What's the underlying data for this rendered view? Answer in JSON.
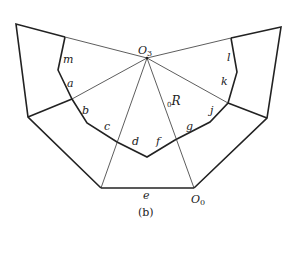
{
  "figure": {
    "caption": "(b)",
    "points": {
      "O3": "O",
      "O3_sub": "3",
      "O0": "O",
      "O0_sub": "0",
      "R": "R",
      "R_prefix": "0"
    },
    "edge_labels": {
      "m": "m",
      "a": "a",
      "b": "b",
      "c": "c",
      "d": "d",
      "e": "e",
      "f": "f",
      "g": "g",
      "j": "j",
      "k": "k",
      "l": "l"
    }
  }
}
